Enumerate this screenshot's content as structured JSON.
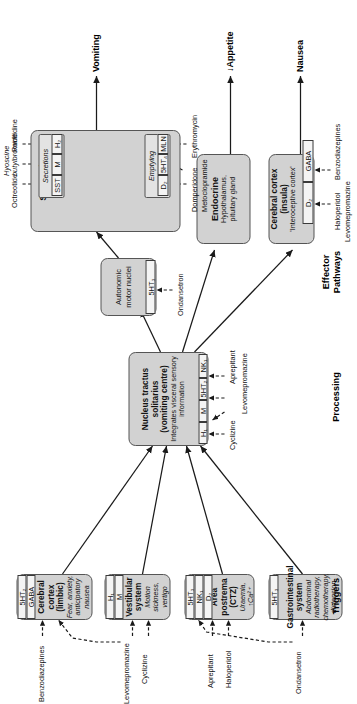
{
  "diagram": {
    "colors": {
      "box_fill": "#d2d2d2",
      "box_border": "#555555",
      "receptor_fill": "#f4f4f4",
      "receptor_border": "#3a3a3a",
      "background": "#ffffff",
      "arrow": "#1a1a1a"
    }
  },
  "columns": [
    {
      "id": "triggers",
      "label": "Triggers"
    },
    {
      "id": "processing",
      "label": "Processing"
    },
    {
      "id": "effectors",
      "label": "Effector\nPathways"
    }
  ],
  "nodes": {
    "cortex_limbic": {
      "title": "Cerebral cortex (limbic)",
      "sub": "Fear, anxiety,\nanticipatory nausea",
      "receptors": [
        "5HT2",
        "GABA"
      ]
    },
    "vestibular": {
      "title": "Vestibular system",
      "sub": "Motion sickness, vertigo",
      "receptors": [
        "H1",
        "M"
      ]
    },
    "area_postrema": {
      "title": "Area postrema\n(CTZ)",
      "sub": "Uraemia, ↑Ca²⁺",
      "receptors": [
        "5HT3",
        "NK1",
        "D2"
      ]
    },
    "gi_system": {
      "title": "Gastrointestinal system",
      "sub": "Abdominal radiotherapy,\nchemotherapy, distension",
      "receptors": [
        "5HT3"
      ]
    },
    "nts": {
      "title": "Nucleus tractus solitarius\n(vomiting centre)",
      "sub": "Integrates visceral sensory\ninformation",
      "receptors": [
        "H1",
        "M",
        "5HT2",
        "NK1"
      ]
    },
    "autonomic": {
      "title": "Autonomic motor nuclei",
      "receptors": [
        "5HT3"
      ]
    },
    "stomach": {
      "title": "Stomach",
      "groups": [
        {
          "name": "Emptying",
          "receptors": [
            "D2",
            "5HT4",
            "MLN"
          ]
        },
        {
          "name": "Secretions",
          "receptors": [
            "SST",
            "M",
            "H2"
          ]
        }
      ]
    },
    "endocrine": {
      "title": "Endocrine",
      "sub": "Hypothalamus,\npituitary gland"
    },
    "cortex_insula": {
      "title": "Cerebral cortex (insula)",
      "quo": "'Interoceptive cortex'",
      "receptors": [
        "D2",
        "GABA"
      ]
    }
  },
  "receptor_labels": {
    "5HT2": "5HT₂",
    "5HT3": "5HT₃",
    "5HT4": "5HT₄",
    "GABA": "GABA",
    "H1": "H₁",
    "H2": "H₂",
    "M": "M",
    "D2": "D₂",
    "NK1": "NK₁",
    "MLN": "MLN",
    "SST": "SST"
  },
  "drugs": {
    "benzodiazepines": "Benzodiazepines",
    "levomepromazine_vest": "Levomepromazine",
    "cyclizine_vest": "Cyclizine",
    "aprepitant_ap": "Aprepitant",
    "haloperidol_ap": "Haloperidol",
    "ondansetron_gi": "Ondansetron",
    "cyclizine_nts": "Cyclizine",
    "levomepromazine_nts": "Levomepromazine",
    "aprepitant_nts": "Aprepitant",
    "ondansetron_auto": "Ondansetron",
    "domperidone": "Domperidone",
    "metoclopramide": "Metoclopramide",
    "erythromycin": "Erythromycin",
    "octreotide": "Octreotide",
    "hyoscine_butylbromide": "Hyoscine\nbutylbromide",
    "ranitidine": "Ranitidine",
    "haloperidol_insula": "Haloperidol",
    "levomepromazine_insula": "Levomepromazine",
    "benzodiazepines_insula": "Benzodiazepines"
  },
  "outcomes": {
    "vomiting": "Vomiting",
    "appetite": "↓Appetite",
    "nausea": "Nausea"
  }
}
